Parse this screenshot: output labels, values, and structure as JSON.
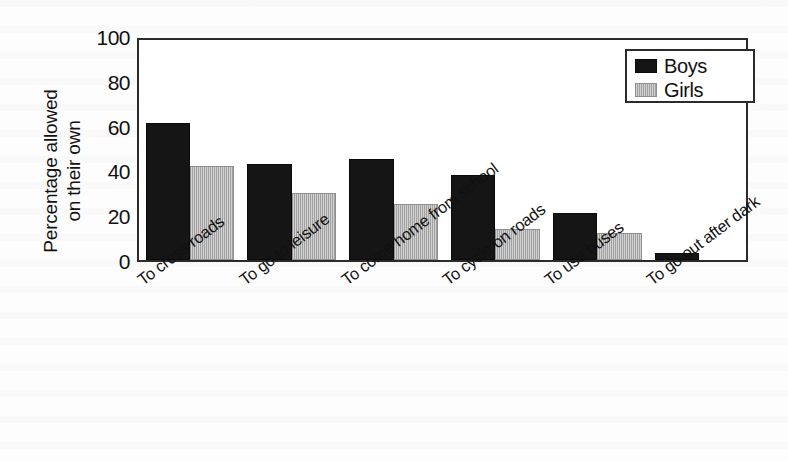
{
  "chart_data": {
    "type": "bar",
    "title": "",
    "xlabel": "",
    "ylabel": "Percentage allowed on their own",
    "ylabel_line1": "Percentage allowed",
    "ylabel_line2": "on their own",
    "ylim": [
      0,
      100
    ],
    "yticks": [
      100,
      80,
      60,
      40,
      20,
      0
    ],
    "ytick_labels": [
      "100",
      "80",
      "60",
      "40",
      "20",
      "0"
    ],
    "grid": false,
    "legend_position": "top-right",
    "categories": [
      "To cross roads",
      "To go to leisure",
      "To come home from school",
      "To cycle on roads",
      "To use buses",
      "To go out after dark"
    ],
    "series": [
      {
        "name": "Boys",
        "color": "#151515",
        "values": [
          61,
          43,
          45,
          38,
          21,
          3
        ]
      },
      {
        "name": "Girls",
        "color": "#ababab",
        "values": [
          42,
          30,
          25,
          14,
          12,
          0
        ]
      }
    ]
  },
  "legend": {
    "entries": [
      {
        "label": "Boys",
        "swatch": "boys"
      },
      {
        "label": "Girls",
        "swatch": "girls"
      }
    ]
  }
}
